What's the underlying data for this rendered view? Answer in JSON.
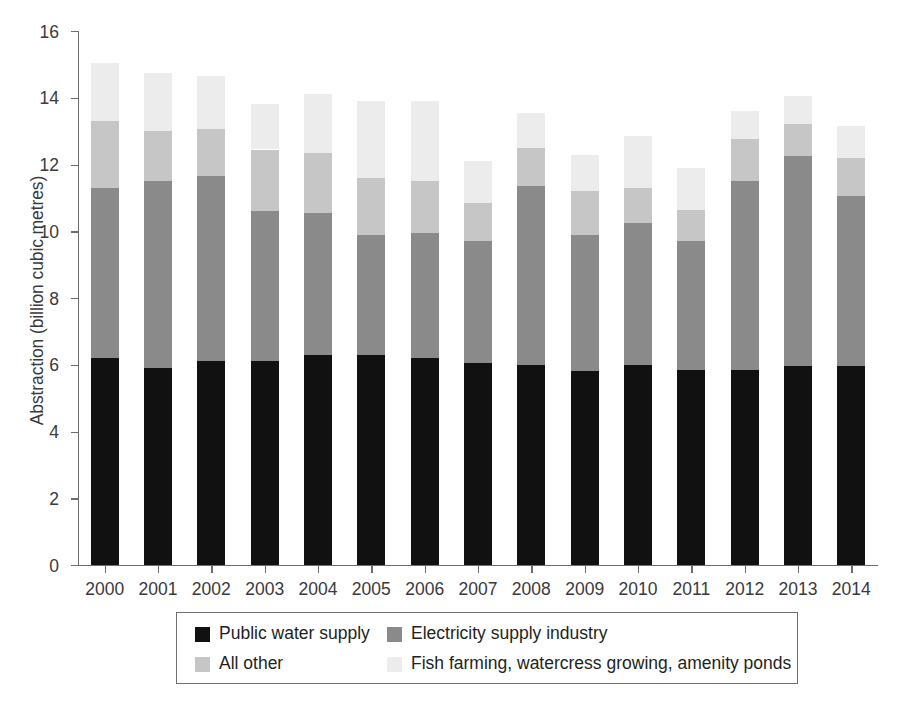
{
  "chart_data": {
    "type": "bar",
    "subtype": "stacked-bar",
    "title": "",
    "xlabel": "",
    "ylabel": "Abstraction (billion cubic metres)",
    "ylim": [
      0,
      16
    ],
    "ytick_step": 2,
    "yticks": [
      "0",
      "2",
      "4",
      "6",
      "8",
      "10",
      "12",
      "14",
      "16"
    ],
    "grid": false,
    "legend_position": "bottom",
    "categories": [
      "2000",
      "2001",
      "2002",
      "2003",
      "2004",
      "2005",
      "2006",
      "2007",
      "2008",
      "2009",
      "2010",
      "2011",
      "2012",
      "2013",
      "2014"
    ],
    "series": [
      {
        "name": "Public water supply",
        "color": "#111111",
        "values": [
          6.2,
          5.9,
          6.1,
          6.1,
          6.3,
          6.3,
          6.2,
          6.05,
          6.0,
          5.8,
          6.0,
          5.85,
          5.85,
          5.95,
          5.95
        ]
      },
      {
        "name": "Electricity supply industry",
        "color": "#8a8a8a",
        "values": [
          5.1,
          5.6,
          5.55,
          4.5,
          4.25,
          3.6,
          3.75,
          3.65,
          5.35,
          4.1,
          4.25,
          3.85,
          5.65,
          6.3,
          5.1
        ]
      },
      {
        "name": "All other",
        "color": "#c6c6c6",
        "values": [
          2.0,
          1.5,
          1.4,
          1.85,
          1.8,
          1.7,
          1.55,
          1.15,
          1.15,
          1.3,
          1.05,
          0.95,
          1.25,
          0.95,
          1.15
        ]
      },
      {
        "name": "Fish farming, watercress growing, amenity ponds",
        "color": "#ececec",
        "values": [
          1.75,
          1.75,
          1.6,
          1.35,
          1.75,
          2.3,
          2.4,
          1.25,
          1.05,
          1.1,
          1.55,
          1.25,
          0.85,
          0.85,
          0.95
        ]
      }
    ],
    "totals": [
      15.05,
      14.75,
      14.65,
      13.8,
      14.1,
      13.9,
      13.9,
      12.1,
      13.55,
      12.3,
      12.85,
      11.9,
      13.6,
      14.05,
      13.15
    ]
  },
  "legend": {
    "entries": [
      {
        "label": "Public water supply",
        "color": "#111111"
      },
      {
        "label": "Electricity supply industry",
        "color": "#8a8a8a"
      },
      {
        "label": "All other",
        "color": "#c6c6c6"
      },
      {
        "label": "Fish farming, watercress growing, amenity ponds",
        "color": "#ececec"
      }
    ]
  },
  "colors": {
    "axis": "#6d6e71",
    "text": "#231f20",
    "tick_text": "#3a3a3c",
    "background": "#ffffff"
  }
}
